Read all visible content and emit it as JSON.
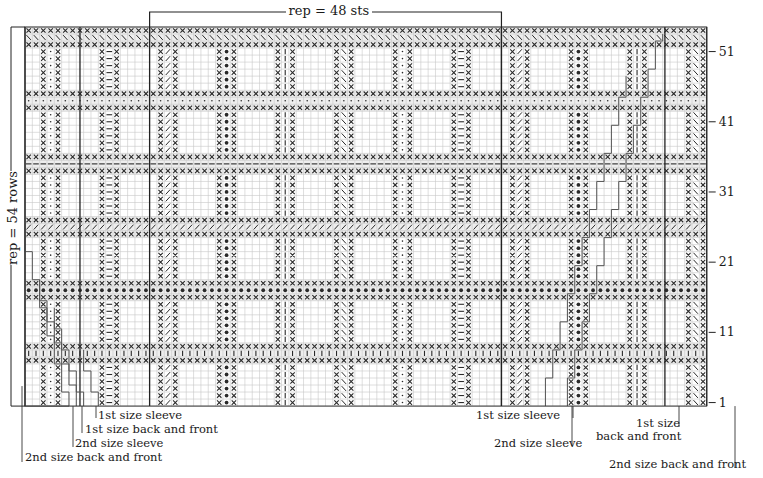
{
  "grid": {
    "x0": 25,
    "y0": 27,
    "cols": 93,
    "rows": 54,
    "cell_w": 7.33,
    "cell_h": 7.02,
    "grid_color": "#c8c8c8",
    "grid_major_color": "#9a9a9a",
    "ink_color": "#2a2a2a",
    "band_fill": "#eeeeee"
  },
  "repeat": {
    "stitches_label": "rep = 48 sts",
    "rows_label": "rep = 54 rows",
    "stitch_start_col": 17,
    "stitch_end_col": 65
  },
  "row_numbers": [
    {
      "label": "51",
      "row": 51
    },
    {
      "label": "41",
      "row": 41
    },
    {
      "label": "31",
      "row": 31
    },
    {
      "label": "21",
      "row": 21
    },
    {
      "label": "11",
      "row": 11
    },
    {
      "label": "1",
      "row": 1
    }
  ],
  "bands": [
    {
      "rows": [
        54,
        52
      ],
      "center_row": 53,
      "symbol": "\\"
    },
    {
      "rows": [
        45,
        43
      ],
      "center_row": 44,
      "symbol": "·"
    },
    {
      "rows": [
        36,
        34
      ],
      "center_row": 35,
      "symbol": "—"
    },
    {
      "rows": [
        27,
        25
      ],
      "center_row": 26,
      "symbol": "/"
    },
    {
      "rows": [
        18,
        16
      ],
      "center_row": 17,
      "symbol": "●"
    },
    {
      "rows": [
        9,
        7
      ],
      "center_row": 8,
      "symbol": "|"
    }
  ],
  "motif_blocks": [
    {
      "rows": [
        51,
        46
      ]
    },
    {
      "rows": [
        42,
        37
      ]
    },
    {
      "rows": [
        33,
        28
      ]
    },
    {
      "rows": [
        24,
        19
      ]
    },
    {
      "rows": [
        15,
        10
      ]
    },
    {
      "rows": [
        6,
        1
      ]
    }
  ],
  "motif_columns": [
    {
      "col": 3,
      "symbol": "·"
    },
    {
      "col": 11,
      "symbol": "—"
    },
    {
      "col": 19,
      "symbol": "/"
    },
    {
      "col": 27,
      "symbol": "●"
    },
    {
      "col": 35,
      "symbol": "|"
    },
    {
      "col": 43,
      "symbol": "\\"
    },
    {
      "col": 51,
      "symbol": "·"
    },
    {
      "col": 59,
      "symbol": "—"
    },
    {
      "col": 67,
      "symbol": "/"
    },
    {
      "col": 75,
      "symbol": "●"
    },
    {
      "col": 83,
      "symbol": "|"
    },
    {
      "col": 91,
      "symbol": "\\"
    }
  ],
  "size_labels": {
    "left": [
      {
        "text": "1st size sleeve",
        "x": 98,
        "y": 409
      },
      {
        "text": "1st size back and front",
        "x": 85,
        "y": 423
      },
      {
        "text": "2nd size sleeve",
        "x": 75,
        "y": 437
      },
      {
        "text": "2nd size back and front",
        "x": 25,
        "y": 451
      }
    ],
    "right": [
      {
        "text": "1st size sleeve",
        "x": 476,
        "y": 409
      },
      {
        "text": "2nd size sleeve",
        "x": 494,
        "y": 437
      },
      {
        "text": "1st size",
        "x": 636,
        "y": 417
      },
      {
        "text": "back and front",
        "x": 596,
        "y": 430
      },
      {
        "text": "2nd size back and front",
        "x": 609,
        "y": 458
      }
    ]
  },
  "vertical_rules": [
    {
      "name": "left-edge-2nd-back-front",
      "col": 0
    },
    {
      "name": "left-edge-1st-back-front",
      "col": 7.5
    },
    {
      "name": "rep-left",
      "col": 17
    },
    {
      "name": "rep-right",
      "col": 65
    },
    {
      "name": "right-edge-1st-back-front",
      "col": 87.3
    },
    {
      "name": "right-edge-2nd-back-front",
      "col": 93
    }
  ]
}
